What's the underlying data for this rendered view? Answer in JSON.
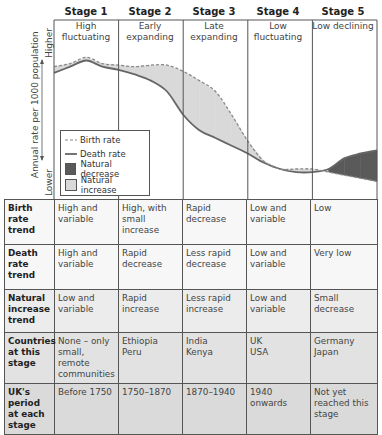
{
  "chart_data": {
    "type": "area",
    "ylabel": "Annual rate per 1000 population",
    "y_axis_high_label": "Higher",
    "y_axis_low_label": "Lower",
    "stages": [
      {
        "label": "Stage 1",
        "description": "High fluctuating"
      },
      {
        "label": "Stage 2",
        "description": "Early expanding"
      },
      {
        "label": "Stage 3",
        "description": "Late expanding"
      },
      {
        "label": "Stage 4",
        "description": "Low fluctuating"
      },
      {
        "label": "Stage 5",
        "description": "Low declining"
      }
    ],
    "x_stage_position": [
      0,
      0.25,
      0.5,
      0.75,
      1.0,
      1.25,
      1.5,
      1.75,
      2.0,
      2.25,
      2.5,
      2.75,
      3.0,
      3.25,
      3.5,
      3.75,
      4.0,
      4.25,
      4.5,
      4.75,
      5.0
    ],
    "series": [
      {
        "name": "Birth rate",
        "style": "dashed",
        "values": [
          86,
          88,
          92,
          88,
          87,
          86,
          87,
          87,
          83,
          77,
          70,
          55,
          38,
          25,
          20,
          20,
          20,
          18,
          16,
          14,
          12
        ]
      },
      {
        "name": "Death rate",
        "style": "solid",
        "values": [
          82,
          86,
          90,
          86,
          84,
          81,
          77,
          70,
          55,
          45,
          40,
          35,
          30,
          24,
          20,
          18,
          18,
          20,
          27,
          30,
          32
        ]
      }
    ],
    "y_range_relative": [
      0,
      100
    ],
    "legend": [
      {
        "label": "Birth rate",
        "symbol": "dashed-line"
      },
      {
        "label": "Death rate",
        "symbol": "solid-line"
      },
      {
        "label": "Natural decrease",
        "symbol": "dark-fill",
        "color": "#5a5a5a"
      },
      {
        "label": "Natural increase",
        "symbol": "light-fill",
        "color": "#d9d9d9"
      }
    ],
    "legend_position": "bottom-left",
    "grid": false
  },
  "table": {
    "rows": [
      {
        "header": "Birth rate trend",
        "cells": [
          "High and variable",
          "High, with small increase",
          "Rapid decrease",
          "Low and variable",
          "Low"
        ]
      },
      {
        "header": "Death rate trend",
        "cells": [
          "High and variable",
          "Rapid decrease",
          "Less rapid decrease",
          "Low and variable",
          "Very low"
        ]
      },
      {
        "header": "Natural increase trend",
        "cells": [
          "Low and variable",
          "Rapid increase",
          "Less rapid increase",
          "Low and variable",
          "Small decrease"
        ]
      },
      {
        "header": "Countries at this stage",
        "cells": [
          "None – only small, remote communities",
          "Ethiopia\nPeru",
          "India\nKenya",
          "UK\nUSA",
          "Germany\nJapan"
        ]
      },
      {
        "header": "UK's period at each stage",
        "cells": [
          "Before 1750",
          "1750–1870",
          "1870–1940",
          "1940 onwards",
          "Not yet reached this stage"
        ]
      }
    ]
  },
  "colors": {
    "natural_increase": "#d9d9d9",
    "natural_decrease": "#5a5a5a",
    "line": "#666666",
    "border": "#555555"
  }
}
